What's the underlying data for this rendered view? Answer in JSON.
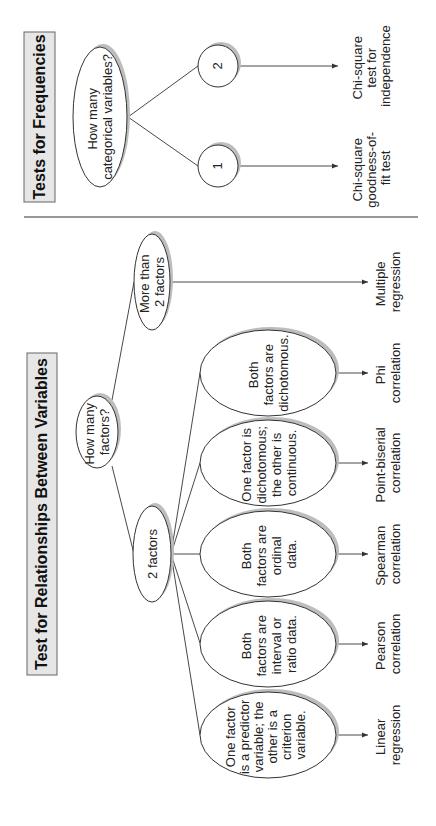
{
  "frequencies": {
    "title": "Tests for Frequencies",
    "question": [
      "How many",
      "categorical variables?"
    ],
    "options": [
      {
        "label": "1",
        "result": [
          "Chi-square",
          "goodness-of-",
          "fit test"
        ]
      },
      {
        "label": "2",
        "result": [
          "Chi-square",
          "test for",
          "independence"
        ]
      }
    ]
  },
  "relationships": {
    "title": "Test for Relationships Between Variables",
    "question": [
      "How many",
      "factors?"
    ],
    "branch_more": {
      "label": [
        "More than",
        "2 factors"
      ],
      "result": [
        "Multiple",
        "regression"
      ]
    },
    "branch_two": {
      "label": "2 factors"
    },
    "conditions": [
      {
        "text": [
          "One factor",
          "is a predictor",
          "variable; the",
          "other is a",
          "criterion",
          "variable."
        ],
        "result": [
          "Linear",
          "regression"
        ]
      },
      {
        "text": [
          "Both",
          "factors are",
          "interval or",
          "ratio data."
        ],
        "result": [
          "Pearson",
          "correlation"
        ]
      },
      {
        "text": [
          "Both",
          "factors are",
          "ordinal",
          "data."
        ],
        "result": [
          "Spearman",
          "correlation"
        ]
      },
      {
        "text": [
          "One factor is",
          "dichotomous;",
          "the other is",
          "continuous."
        ],
        "result": [
          "Point-biserial",
          "correlation"
        ]
      },
      {
        "text": [
          "Both",
          "factors are",
          "dichotomous."
        ],
        "result": [
          "Phi",
          "correlation"
        ]
      }
    ]
  },
  "colors": {
    "title_box_fill": "#e6e6e6",
    "line": "#333333",
    "shadow": "#bdbdbd"
  }
}
